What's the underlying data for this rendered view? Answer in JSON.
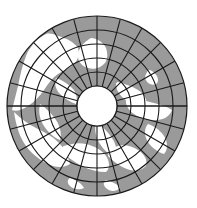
{
  "figure": {
    "title": "North Polar Azimuthal Projection Map",
    "background_color": "#ffffff"
  },
  "colors": {
    "ocean": "#9a9a9a",
    "land": "#ffffff",
    "graticule": "#1a1a1a",
    "outline": "#1a1a1a",
    "pole_hole": "#ffffff",
    "background": "#ffffff"
  },
  "projection": {
    "type": "azimuthal-polar",
    "center_x": 97,
    "center_y": 106,
    "outer_radius": 90,
    "pole_hole_radius": 20,
    "meridian_count": 24,
    "meridian_step_degrees": 15,
    "parallel_count": 5,
    "parallel_radii": [
      20,
      34,
      48,
      62,
      76,
      90
    ],
    "equator_line": true,
    "equator_y": 106,
    "outline_width": 1.2,
    "graticule_width": 1.1
  },
  "chart_data": {
    "type": "map",
    "title": "North Polar Azimuthal Projection Map",
    "xlabel": "",
    "ylabel": "",
    "grid": true,
    "legend": [
      {
        "name": "Ocean",
        "color": "#9a9a9a"
      },
      {
        "name": "Land",
        "color": "#ffffff"
      }
    ],
    "parallels": [
      {
        "radius": 20,
        "label": ""
      },
      {
        "radius": 34,
        "label": ""
      },
      {
        "radius": 48,
        "label": ""
      },
      {
        "radius": 62,
        "label": ""
      },
      {
        "radius": 76,
        "label": ""
      },
      {
        "radius": 90,
        "label": ""
      }
    ],
    "meridians": [
      0,
      15,
      30,
      45,
      60,
      75,
      90,
      105,
      120,
      135,
      150,
      165,
      180,
      195,
      210,
      225,
      240,
      255,
      270,
      285,
      300,
      315,
      330,
      345
    ],
    "land_regions": [
      {
        "name": "north-america",
        "path": "M 46 34 C 38 38 30 46 26 56 C 22 66 20 76 18 86 C 16 94 14 102 12 110 C 16 112 22 110 28 106 C 34 102 40 96 44 90 C 48 84 52 78 58 74 C 64 70 70 68 74 64 C 78 60 80 54 78 48 C 74 42 66 38 58 36 C 54 34 50 33 46 34 Z"
      },
      {
        "name": "greenland",
        "path": "M 88 40 C 82 44 78 50 78 56 C 78 62 82 66 88 68 C 94 70 100 68 104 64 C 108 60 108 54 106 48 C 104 43 98 39 92 38 C 90 38 89 39 88 40 Z"
      },
      {
        "name": "alaska-siberia-bridge",
        "path": "M 14 112 C 20 118 28 124 36 128 C 44 132 52 136 58 142 C 64 148 68 156 70 164 C 64 168 56 168 48 164 C 40 160 32 154 26 146 C 20 138 16 126 14 112 Z"
      },
      {
        "name": "siberia",
        "path": "M 60 150 C 66 156 74 162 82 166 C 90 170 98 172 106 172 C 110 168 110 162 106 156 C 102 150 94 146 86 144 C 78 142 70 144 64 146 C 62 147 61 148 60 150 Z"
      },
      {
        "name": "eurasia-east",
        "path": "M 108 156 C 114 162 122 168 130 170 C 136 172 142 170 146 166 C 148 160 144 154 138 150 C 132 146 124 144 118 146 C 112 148 109 152 108 156 Z"
      },
      {
        "name": "europe",
        "path": "M 128 96 C 134 98 142 100 150 102 C 158 104 166 106 172 110 C 170 116 164 120 156 120 C 148 120 140 118 134 114 C 128 110 125 104 126 98 C 126 97 127 96 128 96 Z"
      },
      {
        "name": "scandinavia",
        "path": "M 118 82 C 124 84 132 86 138 90 C 144 94 148 100 146 106 C 140 106 132 104 126 100 C 120 96 116 90 116 84 C 116 83 117 82 118 82 Z"
      },
      {
        "name": "iceland-isles",
        "path": "M 148 124 C 154 126 160 130 164 136 C 168 142 168 150 164 154 C 158 152 152 148 148 142 C 144 136 144 128 148 124 Z"
      },
      {
        "name": "north-atlantic-coast",
        "path": "M 96 122 C 102 126 108 132 112 138 C 116 144 118 152 116 158 C 110 156 104 150 100 144 C 96 138 94 130 96 122 Z"
      },
      {
        "name": "canadian-arctic",
        "path": "M 56 78 C 62 80 68 84 72 88 C 76 92 78 98 76 104 C 70 102 64 98 60 94 C 56 90 54 84 56 78 Z"
      },
      {
        "name": "hudson-bay-land",
        "path": "M 40 104 C 46 108 52 114 56 120 C 60 126 62 134 60 140 C 54 138 48 132 44 126 C 40 120 38 112 40 104 Z"
      },
      {
        "name": "small-isle-a",
        "path": "M 150 70 C 154 72 158 76 158 80 C 158 84 154 86 150 84 C 146 82 144 78 146 74 C 147 72 148 70 150 70 Z"
      },
      {
        "name": "small-isle-b",
        "path": "M 70 178 C 76 180 82 184 84 188 C 80 190 74 190 70 186 C 67 183 67 180 70 178 Z"
      },
      {
        "name": "small-isle-c",
        "path": "M 106 180 C 112 182 118 184 120 188 C 116 192 110 192 106 188 C 103 185 103 182 106 180 Z"
      }
    ]
  }
}
